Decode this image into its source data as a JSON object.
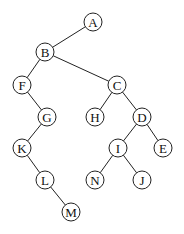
{
  "diagram": {
    "type": "binary-tree",
    "node_radius": 9,
    "colors": {
      "stroke": "#222222",
      "fill": "#ffffff",
      "text": "#111111"
    },
    "nodes": [
      {
        "id": "A",
        "label": "A",
        "x": 93,
        "y": 22
      },
      {
        "id": "B",
        "label": "B",
        "x": 45,
        "y": 52
      },
      {
        "id": "F",
        "label": "F",
        "x": 22,
        "y": 85
      },
      {
        "id": "C",
        "label": "C",
        "x": 117,
        "y": 85
      },
      {
        "id": "G",
        "label": "G",
        "x": 47,
        "y": 117
      },
      {
        "id": "H",
        "label": "H",
        "x": 95,
        "y": 117
      },
      {
        "id": "D",
        "label": "D",
        "x": 142,
        "y": 117
      },
      {
        "id": "K",
        "label": "K",
        "x": 22,
        "y": 148
      },
      {
        "id": "I",
        "label": "I",
        "x": 118,
        "y": 148
      },
      {
        "id": "E",
        "label": "E",
        "x": 163,
        "y": 148
      },
      {
        "id": "L",
        "label": "L",
        "x": 45,
        "y": 180
      },
      {
        "id": "N",
        "label": "N",
        "x": 95,
        "y": 180
      },
      {
        "id": "J",
        "label": "J",
        "x": 142,
        "y": 180
      },
      {
        "id": "M",
        "label": "M",
        "x": 71,
        "y": 212
      }
    ],
    "edges": [
      {
        "from": "A",
        "to": "B"
      },
      {
        "from": "B",
        "to": "F"
      },
      {
        "from": "B",
        "to": "C"
      },
      {
        "from": "F",
        "to": "G"
      },
      {
        "from": "C",
        "to": "H"
      },
      {
        "from": "C",
        "to": "D"
      },
      {
        "from": "G",
        "to": "K"
      },
      {
        "from": "D",
        "to": "I"
      },
      {
        "from": "D",
        "to": "E"
      },
      {
        "from": "K",
        "to": "L"
      },
      {
        "from": "I",
        "to": "N"
      },
      {
        "from": "I",
        "to": "J"
      },
      {
        "from": "L",
        "to": "M"
      }
    ]
  }
}
